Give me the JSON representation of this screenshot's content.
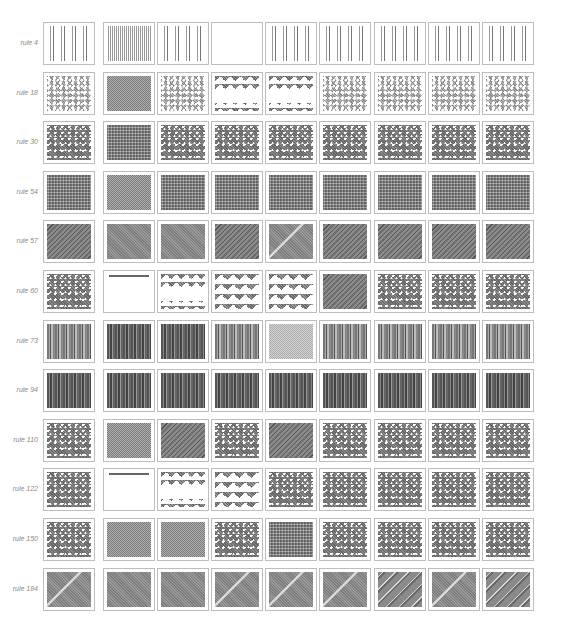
{
  "figure": {
    "rows": [
      {
        "label": "rule 4",
        "patterns": [
          "vstripes",
          "vstripes-dense",
          "vstripes",
          "white",
          "vstripes",
          "vstripes",
          "vstripes",
          "vstripes",
          "vstripes"
        ]
      },
      {
        "label": "rule 18",
        "patterns": [
          "light-chaos",
          "checker",
          "light-chaos",
          "tri-top",
          "tri-top",
          "light-chaos",
          "light-chaos",
          "light-chaos",
          "light-chaos"
        ]
      },
      {
        "label": "rule 30",
        "patterns": [
          "chaos",
          "dense",
          "chaos",
          "chaos",
          "chaos",
          "chaos",
          "chaos",
          "chaos",
          "chaos"
        ]
      },
      {
        "label": "rule 54",
        "patterns": [
          "dense",
          "checker",
          "dense",
          "dense",
          "dense",
          "dense",
          "dense",
          "dense",
          "dense"
        ]
      },
      {
        "label": "rule 57",
        "patterns": [
          "diag",
          "gray",
          "gray",
          "diag",
          "diag-light",
          "diag",
          "diag",
          "diag",
          "diag"
        ]
      },
      {
        "label": "rule 60",
        "patterns": [
          "chaos",
          "topline",
          "tri-top",
          "tri-half",
          "tri-half",
          "diag",
          "chaos",
          "chaos",
          "chaos"
        ]
      },
      {
        "label": "rule 73",
        "patterns": [
          "vstripes-mid",
          "vstripes-dark",
          "vstripes-dark",
          "vstripes-mid",
          "noise",
          "vstripes-mid",
          "vstripes-mid",
          "vstripes-mid",
          "vstripes-mid"
        ]
      },
      {
        "label": "rule 94",
        "patterns": [
          "vstripes-dark",
          "vstripes-dark",
          "vstripes-dark",
          "vstripes-dark",
          "vstripes-dark",
          "vstripes-dark",
          "vstripes-dark",
          "vstripes-dark",
          "vstripes-dark"
        ]
      },
      {
        "label": "rule 110",
        "patterns": [
          "chaos",
          "checker",
          "diag",
          "chaos",
          "diag",
          "chaos",
          "chaos",
          "chaos",
          "chaos"
        ]
      },
      {
        "label": "rule 122",
        "patterns": [
          "chaos",
          "topline",
          "tri-top",
          "tri-half",
          "chaos",
          "chaos",
          "chaos",
          "chaos",
          "chaos"
        ]
      },
      {
        "label": "rule 150",
        "patterns": [
          "chaos",
          "checker",
          "checker",
          "chaos",
          "dense",
          "chaos",
          "chaos",
          "chaos",
          "chaos"
        ]
      },
      {
        "label": "rule 184",
        "patterns": [
          "diag-light",
          "gray",
          "gray",
          "diag-light",
          "diag-light",
          "diag-light",
          "diag-wide",
          "diag-light",
          "diag-wide"
        ]
      }
    ],
    "column_captions": [
      "(a)",
      "(b)",
      "(c)",
      "(d)",
      "(e)",
      "(f)",
      "(g)",
      "(h)"
    ]
  }
}
